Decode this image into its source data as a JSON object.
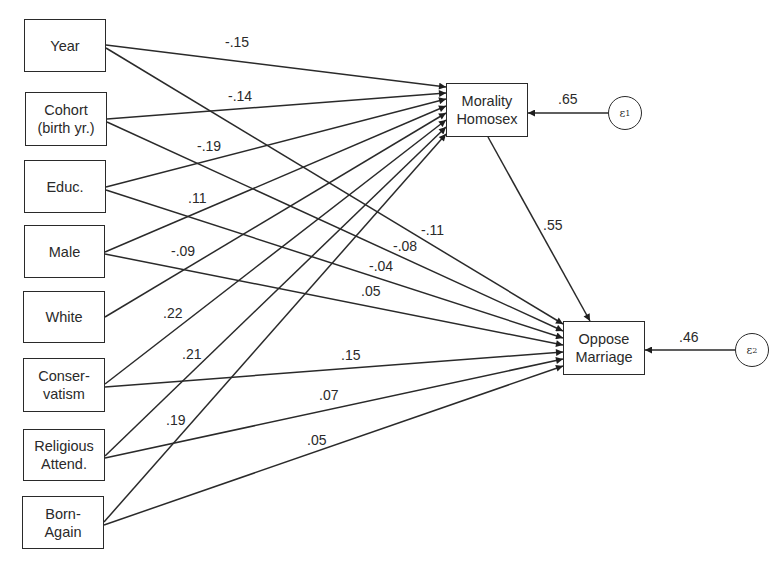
{
  "diagram": {
    "type": "path-diagram",
    "exogenous": [
      {
        "id": "year",
        "label": "Year"
      },
      {
        "id": "cohort",
        "label": "Cohort\n(birth yr.)"
      },
      {
        "id": "educ",
        "label": "Educ."
      },
      {
        "id": "male",
        "label": "Male"
      },
      {
        "id": "white",
        "label": "White"
      },
      {
        "id": "conservatism",
        "label": "Conser-\nvatism"
      },
      {
        "id": "religious",
        "label": "Religious\nAttend."
      },
      {
        "id": "bornagain",
        "label": "Born-\nAgain"
      }
    ],
    "endogenous": [
      {
        "id": "morality",
        "label": "Morality\nHomosex"
      },
      {
        "id": "oppose",
        "label": "Oppose\nMarriage"
      }
    ],
    "errors": [
      {
        "id": "e1",
        "symbol": "ε",
        "sub": "1",
        "target": "morality",
        "coef": ".65"
      },
      {
        "id": "e2",
        "symbol": "ε",
        "sub": "2",
        "target": "oppose",
        "coef": ".46"
      }
    ],
    "paths": [
      {
        "from": "year",
        "to": "morality",
        "coef": "-.15"
      },
      {
        "from": "cohort",
        "to": "morality",
        "coef": "-.14"
      },
      {
        "from": "educ",
        "to": "morality",
        "coef": "-.19"
      },
      {
        "from": "male",
        "to": "morality",
        "coef": ".11"
      },
      {
        "from": "white",
        "to": "morality",
        "coef": "-.09"
      },
      {
        "from": "conservatism",
        "to": "morality",
        "coef": ".22"
      },
      {
        "from": "religious",
        "to": "morality",
        "coef": ".21"
      },
      {
        "from": "bornagain",
        "to": "morality",
        "coef": ".19"
      },
      {
        "from": "year",
        "to": "oppose",
        "coef": "-.11"
      },
      {
        "from": "cohort",
        "to": "oppose",
        "coef": "-.08"
      },
      {
        "from": "educ",
        "to": "oppose",
        "coef": "-.04"
      },
      {
        "from": "male",
        "to": "oppose",
        "coef": ".05"
      },
      {
        "from": "conservatism",
        "to": "oppose",
        "coef": ".15"
      },
      {
        "from": "religious",
        "to": "oppose",
        "coef": ".07"
      },
      {
        "from": "bornagain",
        "to": "oppose",
        "coef": ".05"
      },
      {
        "from": "morality",
        "to": "oppose",
        "coef": ".55"
      }
    ]
  }
}
